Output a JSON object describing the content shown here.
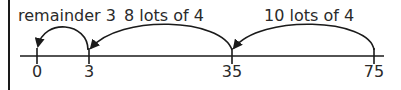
{
  "diagram": {
    "type": "number-line-division",
    "labels": {
      "jump_remainder": "remainder 3",
      "jump_8": "8 lots of 4",
      "jump_10": "10 lots of 4"
    },
    "ticks": [
      {
        "value": "0"
      },
      {
        "value": "3"
      },
      {
        "value": "35"
      },
      {
        "value": "75"
      }
    ],
    "colors": {
      "line": "#1a1a1a",
      "text": "#2a2a2a"
    }
  }
}
